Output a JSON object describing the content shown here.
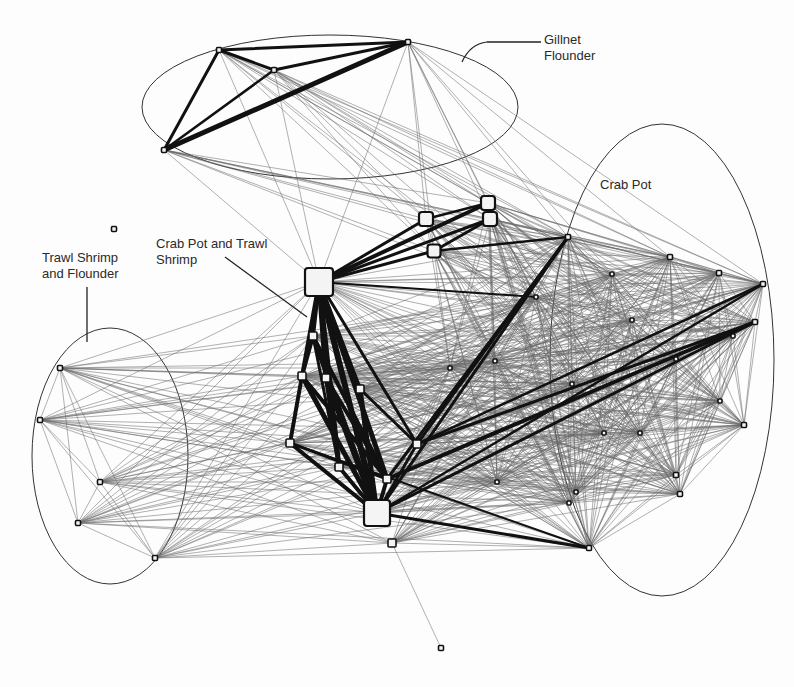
{
  "diagram": {
    "type": "network",
    "width": 794,
    "height": 687,
    "colors": {
      "edge_light": "#6a6a6a",
      "edge_heavy": "#111111",
      "node_fill": "#f4f4f4",
      "node_stroke": "#111111",
      "ellipse": "#333333",
      "text": "#2a2a2a"
    },
    "groups": [
      {
        "id": "gillnet",
        "label": "Gillnet\nFlounder",
        "ellipse": {
          "cx": 330,
          "cy": 107,
          "rx": 188,
          "ry": 72
        },
        "label_pos": {
          "x": 544,
          "y": 32
        },
        "leader": [
          [
            487,
            42
          ],
          [
            541,
            42
          ]
        ]
      },
      {
        "id": "crabpot",
        "label": "Crab Pot",
        "ellipse": {
          "cx": 662,
          "cy": 360,
          "rx": 112,
          "ry": 236
        },
        "label_pos": {
          "x": 600,
          "y": 177
        },
        "leader": null
      },
      {
        "id": "trawl",
        "label": "Trawl Shrimp\nand Flounder",
        "ellipse": {
          "cx": 110,
          "cy": 456,
          "rx": 78,
          "ry": 128
        },
        "label_pos": {
          "x": 42,
          "y": 250
        },
        "leader": [
          [
            87,
            287
          ],
          [
            87,
            342
          ]
        ]
      },
      {
        "id": "mixed",
        "label": "Crab Pot and Trawl\nShrimp",
        "ellipse": null,
        "label_pos": {
          "x": 156,
          "y": 236
        },
        "leader": [
          [
            225,
            257
          ],
          [
            307,
            317
          ]
        ]
      }
    ],
    "nodes": [
      {
        "id": "g1",
        "x": 219,
        "y": 50,
        "size": 5,
        "group": "gillnet"
      },
      {
        "id": "g2",
        "x": 274,
        "y": 70,
        "size": 5,
        "group": "gillnet"
      },
      {
        "id": "g3",
        "x": 408,
        "y": 42,
        "size": 5,
        "group": "gillnet"
      },
      {
        "id": "g4",
        "x": 164,
        "y": 150,
        "size": 5,
        "group": "gillnet"
      },
      {
        "id": "h1",
        "x": 319,
        "y": 282,
        "size": 28,
        "group": "mixed"
      },
      {
        "id": "h2",
        "x": 377,
        "y": 513,
        "size": 26,
        "group": "mixed"
      },
      {
        "id": "h3",
        "x": 426,
        "y": 219,
        "size": 14,
        "group": "mixed"
      },
      {
        "id": "h4",
        "x": 488,
        "y": 203,
        "size": 14,
        "group": "mixed"
      },
      {
        "id": "h5",
        "x": 490,
        "y": 219,
        "size": 14,
        "group": "mixed"
      },
      {
        "id": "h6",
        "x": 434,
        "y": 251,
        "size": 13,
        "group": "mixed"
      },
      {
        "id": "m1",
        "x": 313,
        "y": 336,
        "size": 8,
        "group": "mixed"
      },
      {
        "id": "m2",
        "x": 302,
        "y": 376,
        "size": 8,
        "group": "mixed"
      },
      {
        "id": "m3",
        "x": 326,
        "y": 378,
        "size": 8,
        "group": "mixed"
      },
      {
        "id": "m4",
        "x": 360,
        "y": 389,
        "size": 8,
        "group": "mixed"
      },
      {
        "id": "m5",
        "x": 290,
        "y": 443,
        "size": 8,
        "group": "mixed"
      },
      {
        "id": "m6",
        "x": 339,
        "y": 467,
        "size": 8,
        "group": "mixed"
      },
      {
        "id": "m7",
        "x": 387,
        "y": 479,
        "size": 8,
        "group": "mixed"
      },
      {
        "id": "m8",
        "x": 417,
        "y": 444,
        "size": 8,
        "group": "mixed"
      },
      {
        "id": "m9",
        "x": 392,
        "y": 543,
        "size": 8,
        "group": "mixed"
      },
      {
        "id": "c1",
        "x": 568,
        "y": 237,
        "size": 5,
        "group": "crabpot"
      },
      {
        "id": "c2",
        "x": 670,
        "y": 257,
        "size": 5,
        "group": "crabpot"
      },
      {
        "id": "c3",
        "x": 719,
        "y": 273,
        "size": 5,
        "group": "crabpot"
      },
      {
        "id": "c4",
        "x": 763,
        "y": 284,
        "size": 5,
        "group": "crabpot"
      },
      {
        "id": "c5",
        "x": 612,
        "y": 274,
        "size": 4,
        "group": "crabpot"
      },
      {
        "id": "c6",
        "x": 536,
        "y": 297,
        "size": 4,
        "group": "crabpot"
      },
      {
        "id": "c7",
        "x": 632,
        "y": 320,
        "size": 4,
        "group": "crabpot"
      },
      {
        "id": "c8",
        "x": 755,
        "y": 322,
        "size": 5,
        "group": "crabpot"
      },
      {
        "id": "c9",
        "x": 733,
        "y": 336,
        "size": 4,
        "group": "crabpot"
      },
      {
        "id": "c10",
        "x": 676,
        "y": 359,
        "size": 4,
        "group": "crabpot"
      },
      {
        "id": "c11",
        "x": 572,
        "y": 384,
        "size": 4,
        "group": "crabpot"
      },
      {
        "id": "c12",
        "x": 720,
        "y": 401,
        "size": 4,
        "group": "crabpot"
      },
      {
        "id": "c13",
        "x": 744,
        "y": 425,
        "size": 5,
        "group": "crabpot"
      },
      {
        "id": "c14",
        "x": 604,
        "y": 433,
        "size": 4,
        "group": "crabpot"
      },
      {
        "id": "c15",
        "x": 640,
        "y": 433,
        "size": 4,
        "group": "crabpot"
      },
      {
        "id": "c16",
        "x": 676,
        "y": 475,
        "size": 5,
        "group": "crabpot"
      },
      {
        "id": "c17",
        "x": 680,
        "y": 494,
        "size": 5,
        "group": "crabpot"
      },
      {
        "id": "c18",
        "x": 576,
        "y": 492,
        "size": 4,
        "group": "crabpot"
      },
      {
        "id": "c19",
        "x": 497,
        "y": 482,
        "size": 4,
        "group": "crabpot"
      },
      {
        "id": "c20",
        "x": 569,
        "y": 503,
        "size": 4,
        "group": "crabpot"
      },
      {
        "id": "c21",
        "x": 589,
        "y": 548,
        "size": 5,
        "group": "crabpot"
      },
      {
        "id": "c22",
        "x": 495,
        "y": 361,
        "size": 4,
        "group": "crabpot"
      },
      {
        "id": "c23",
        "x": 450,
        "y": 368,
        "size": 4,
        "group": "crabpot"
      },
      {
        "id": "t1",
        "x": 60,
        "y": 368,
        "size": 5,
        "group": "trawl"
      },
      {
        "id": "t2",
        "x": 40,
        "y": 420,
        "size": 5,
        "group": "trawl"
      },
      {
        "id": "t3",
        "x": 100,
        "y": 482,
        "size": 5,
        "group": "trawl"
      },
      {
        "id": "t4",
        "x": 78,
        "y": 523,
        "size": 5,
        "group": "trawl"
      },
      {
        "id": "t5",
        "x": 155,
        "y": 558,
        "size": 5,
        "group": "trawl"
      },
      {
        "id": "iso1",
        "x": 114,
        "y": 229,
        "size": 5,
        "group": "isolated"
      },
      {
        "id": "iso2",
        "x": 441,
        "y": 648,
        "size": 5,
        "group": "isolated"
      }
    ],
    "heavy_edges": [
      [
        "g1",
        "g3",
        3
      ],
      [
        "g1",
        "g2",
        3
      ],
      [
        "g2",
        "g3",
        3
      ],
      [
        "g1",
        "g4",
        3
      ],
      [
        "g2",
        "g4",
        2.5
      ],
      [
        "g3",
        "g4",
        5
      ],
      [
        "h1",
        "h3",
        3
      ],
      [
        "h1",
        "h4",
        4
      ],
      [
        "h1",
        "h5",
        3
      ],
      [
        "h1",
        "h6",
        3
      ],
      [
        "h3",
        "h4",
        2.5
      ],
      [
        "h5",
        "h6",
        3
      ],
      [
        "h4",
        "h5",
        2
      ],
      [
        "h1",
        "m1",
        4
      ],
      [
        "h1",
        "m2",
        4
      ],
      [
        "h1",
        "m3",
        5
      ],
      [
        "h1",
        "m4",
        4
      ],
      [
        "h1",
        "h2",
        6
      ],
      [
        "h1",
        "m6",
        5
      ],
      [
        "h1",
        "m7",
        5
      ],
      [
        "h1",
        "m8",
        3
      ],
      [
        "m1",
        "m2",
        4
      ],
      [
        "m1",
        "h2",
        5
      ],
      [
        "m2",
        "m5",
        4
      ],
      [
        "m2",
        "h2",
        5
      ],
      [
        "m3",
        "h2",
        6
      ],
      [
        "m4",
        "h2",
        5
      ],
      [
        "m5",
        "h2",
        4
      ],
      [
        "m6",
        "h2",
        4
      ],
      [
        "m7",
        "h2",
        4
      ],
      [
        "m8",
        "h2",
        3
      ],
      [
        "m3",
        "m7",
        4
      ],
      [
        "m2",
        "m7",
        4
      ],
      [
        "m1",
        "m7",
        4
      ],
      [
        "m4",
        "m8",
        3
      ],
      [
        "m5",
        "m7",
        3
      ],
      [
        "m3",
        "m6",
        4
      ],
      [
        "m1",
        "m6",
        3
      ],
      [
        "h2",
        "c1",
        3
      ],
      [
        "m7",
        "c1",
        3
      ],
      [
        "m8",
        "c1",
        3
      ],
      [
        "h2",
        "c8",
        3
      ],
      [
        "m7",
        "c8",
        4
      ],
      [
        "m8",
        "c8",
        3
      ],
      [
        "h2",
        "c4",
        2.5
      ],
      [
        "m8",
        "c4",
        2.5
      ],
      [
        "h2",
        "c21",
        3
      ],
      [
        "m5",
        "c21",
        2
      ],
      [
        "h6",
        "c1",
        2.5
      ],
      [
        "h1",
        "c6",
        2
      ]
    ],
    "light_edge_groups": [
      {
        "from": [
          "g1",
          "g2",
          "g3",
          "g4"
        ],
        "to": [
          "h1",
          "h3",
          "h4",
          "h5",
          "h6",
          "c1",
          "c5",
          "c2",
          "c4",
          "c6"
        ]
      },
      {
        "from": [
          "t1",
          "t2",
          "t3",
          "t4",
          "t5"
        ],
        "to": [
          "t1",
          "t2",
          "t3",
          "t4",
          "t5",
          "h1",
          "m1",
          "m2",
          "m3",
          "m5",
          "m6",
          "h2",
          "m9",
          "m8",
          "c6",
          "c11",
          "c14",
          "c19",
          "c20",
          "c21",
          "c22",
          "c23"
        ]
      },
      {
        "from": [
          "c1",
          "c2",
          "c3",
          "c4",
          "c5",
          "c6",
          "c7",
          "c8",
          "c9",
          "c10",
          "c11",
          "c12",
          "c13",
          "c14",
          "c15",
          "c16",
          "c17",
          "c18",
          "c19",
          "c20",
          "c21",
          "c22",
          "c23"
        ],
        "to": [
          "c1",
          "c2",
          "c3",
          "c4",
          "c5",
          "c6",
          "c7",
          "c8",
          "c9",
          "c10",
          "c11",
          "c12",
          "c13",
          "c14",
          "c15",
          "c16",
          "c17",
          "c18",
          "c19",
          "c20",
          "c21",
          "c22",
          "c23",
          "h1",
          "h3",
          "h4",
          "h5",
          "h6",
          "m1",
          "m2",
          "m3",
          "m4",
          "m5",
          "m6",
          "m7",
          "m8",
          "m9",
          "h2"
        ]
      },
      {
        "from": [
          "m9"
        ],
        "to": [
          "iso2"
        ]
      }
    ]
  }
}
